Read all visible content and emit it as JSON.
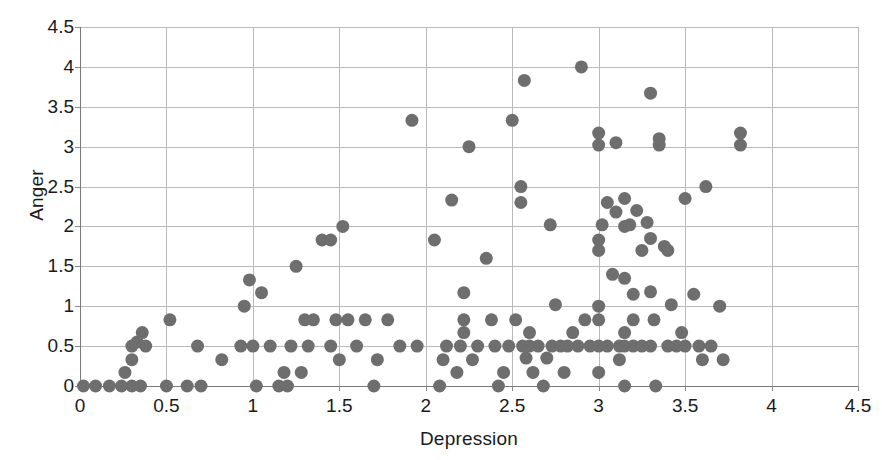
{
  "chart_data": {
    "type": "scatter",
    "title": "",
    "xlabel": "Depression",
    "ylabel": "Anger",
    "xlim": [
      0,
      4.5
    ],
    "ylim": [
      0,
      4.5
    ],
    "xticks": [
      "0",
      "0.5",
      "1",
      "1.5",
      "2",
      "2.5",
      "3",
      "3.5",
      "4",
      "4.5"
    ],
    "xtick_values": [
      0,
      0.5,
      1,
      1.5,
      2,
      2.5,
      3,
      3.5,
      4,
      4.5
    ],
    "yticks": [
      "0",
      "0.5",
      "1",
      "1.5",
      "2",
      "2.5",
      "3",
      "3.5",
      "4",
      "4.5"
    ],
    "ytick_values": [
      0,
      0.5,
      1,
      1.5,
      2,
      2.5,
      3,
      3.5,
      4,
      4.5
    ],
    "grid": true,
    "legend": false,
    "marker": {
      "shape": "circle",
      "color": "#6e6e6e",
      "diameter_px": 13
    },
    "series": [
      {
        "name": "Depression vs Anger",
        "color": "#6e6e6e",
        "points": [
          [
            0.02,
            0.0
          ],
          [
            0.09,
            0.0
          ],
          [
            0.17,
            0.0
          ],
          [
            0.24,
            0.0
          ],
          [
            0.26,
            0.17
          ],
          [
            0.3,
            0.0
          ],
          [
            0.3,
            0.33
          ],
          [
            0.3,
            0.5
          ],
          [
            0.33,
            0.55
          ],
          [
            0.35,
            0.0
          ],
          [
            0.36,
            0.67
          ],
          [
            0.38,
            0.5
          ],
          [
            0.5,
            0.0
          ],
          [
            0.52,
            0.83
          ],
          [
            0.62,
            0.0
          ],
          [
            0.68,
            0.5
          ],
          [
            0.7,
            0.0
          ],
          [
            0.82,
            0.33
          ],
          [
            0.93,
            0.5
          ],
          [
            0.95,
            1.0
          ],
          [
            0.98,
            1.33
          ],
          [
            1.0,
            0.5
          ],
          [
            1.02,
            0.0
          ],
          [
            1.05,
            1.17
          ],
          [
            1.1,
            0.5
          ],
          [
            1.15,
            0.0
          ],
          [
            1.18,
            0.17
          ],
          [
            1.2,
            0.0
          ],
          [
            1.22,
            0.5
          ],
          [
            1.25,
            1.5
          ],
          [
            1.28,
            0.17
          ],
          [
            1.3,
            0.83
          ],
          [
            1.32,
            0.5
          ],
          [
            1.35,
            0.83
          ],
          [
            1.4,
            1.83
          ],
          [
            1.45,
            1.83
          ],
          [
            1.45,
            0.5
          ],
          [
            1.48,
            0.83
          ],
          [
            1.5,
            0.33
          ],
          [
            1.52,
            2.0
          ],
          [
            1.55,
            0.83
          ],
          [
            1.6,
            0.5
          ],
          [
            1.65,
            0.83
          ],
          [
            1.7,
            0.0
          ],
          [
            1.72,
            0.33
          ],
          [
            1.78,
            0.83
          ],
          [
            1.85,
            0.5
          ],
          [
            1.92,
            3.33
          ],
          [
            1.95,
            0.5
          ],
          [
            2.05,
            1.83
          ],
          [
            2.08,
            0.0
          ],
          [
            2.1,
            0.33
          ],
          [
            2.12,
            0.5
          ],
          [
            2.15,
            2.33
          ],
          [
            2.18,
            0.17
          ],
          [
            2.2,
            0.5
          ],
          [
            2.22,
            1.17
          ],
          [
            2.22,
            0.83
          ],
          [
            2.22,
            0.67
          ],
          [
            2.25,
            3.0
          ],
          [
            2.27,
            0.33
          ],
          [
            2.3,
            0.5
          ],
          [
            2.35,
            1.6
          ],
          [
            2.38,
            0.83
          ],
          [
            2.4,
            0.5
          ],
          [
            2.42,
            0.0
          ],
          [
            2.45,
            0.17
          ],
          [
            2.48,
            0.5
          ],
          [
            2.5,
            3.33
          ],
          [
            2.52,
            0.83
          ],
          [
            2.55,
            2.5
          ],
          [
            2.55,
            2.3
          ],
          [
            2.56,
            0.5
          ],
          [
            2.57,
            3.83
          ],
          [
            2.58,
            0.35
          ],
          [
            2.6,
            0.67
          ],
          [
            2.6,
            0.5
          ],
          [
            2.62,
            0.17
          ],
          [
            2.65,
            0.5
          ],
          [
            2.68,
            0.0
          ],
          [
            2.7,
            0.35
          ],
          [
            2.72,
            2.02
          ],
          [
            2.73,
            0.5
          ],
          [
            2.75,
            1.02
          ],
          [
            2.78,
            0.5
          ],
          [
            2.8,
            0.17
          ],
          [
            2.82,
            0.5
          ],
          [
            2.85,
            0.67
          ],
          [
            2.88,
            0.5
          ],
          [
            2.9,
            4.0
          ],
          [
            2.92,
            0.83
          ],
          [
            2.95,
            0.5
          ],
          [
            3.0,
            3.17
          ],
          [
            3.0,
            3.02
          ],
          [
            3.0,
            1.83
          ],
          [
            3.0,
            1.7
          ],
          [
            3.0,
            1.0
          ],
          [
            3.0,
            0.83
          ],
          [
            3.0,
            0.5
          ],
          [
            3.0,
            0.17
          ],
          [
            3.02,
            2.02
          ],
          [
            3.05,
            2.3
          ],
          [
            3.05,
            0.5
          ],
          [
            3.08,
            1.4
          ],
          [
            3.1,
            3.05
          ],
          [
            3.1,
            2.18
          ],
          [
            3.12,
            0.5
          ],
          [
            3.12,
            0.33
          ],
          [
            3.15,
            2.35
          ],
          [
            3.15,
            2.0
          ],
          [
            3.15,
            1.35
          ],
          [
            3.15,
            0.67
          ],
          [
            3.15,
            0.5
          ],
          [
            3.15,
            0.0
          ],
          [
            3.18,
            2.02
          ],
          [
            3.2,
            1.15
          ],
          [
            3.2,
            0.83
          ],
          [
            3.2,
            0.5
          ],
          [
            3.22,
            2.2
          ],
          [
            3.25,
            1.7
          ],
          [
            3.25,
            0.5
          ],
          [
            3.28,
            2.05
          ],
          [
            3.3,
            3.67
          ],
          [
            3.3,
            1.85
          ],
          [
            3.3,
            1.18
          ],
          [
            3.3,
            0.5
          ],
          [
            3.32,
            0.83
          ],
          [
            3.33,
            0.0
          ],
          [
            3.35,
            3.1
          ],
          [
            3.35,
            3.02
          ],
          [
            3.38,
            1.75
          ],
          [
            3.4,
            1.7
          ],
          [
            3.4,
            0.5
          ],
          [
            3.42,
            1.02
          ],
          [
            3.45,
            0.5
          ],
          [
            3.48,
            0.67
          ],
          [
            3.5,
            2.35
          ],
          [
            3.5,
            0.5
          ],
          [
            3.55,
            1.15
          ],
          [
            3.58,
            0.5
          ],
          [
            3.6,
            0.33
          ],
          [
            3.62,
            2.5
          ],
          [
            3.65,
            0.5
          ],
          [
            3.7,
            1.0
          ],
          [
            3.72,
            0.33
          ],
          [
            3.82,
            3.17
          ],
          [
            3.82,
            3.02
          ]
        ]
      }
    ]
  },
  "axes": {
    "y_title": "Anger",
    "x_title": "Depression"
  }
}
